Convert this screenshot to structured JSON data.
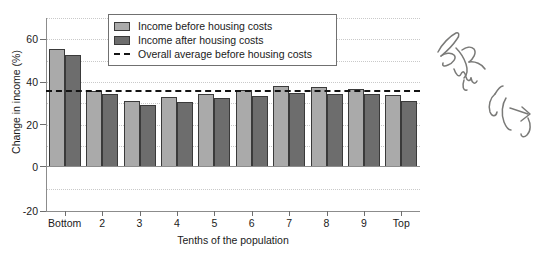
{
  "chart_data": {
    "type": "bar",
    "title": "",
    "xlabel": "Tenths of the population",
    "ylabel": "Change in income (%)",
    "categories": [
      "Bottom",
      "2",
      "3",
      "4",
      "5",
      "6",
      "7",
      "8",
      "9",
      "Top"
    ],
    "series": [
      {
        "name": "Income before housing costs",
        "color": "#aaaaaa",
        "values": [
          55,
          35.5,
          31,
          32.5,
          34,
          36,
          38,
          37.5,
          36.5,
          33.5
        ]
      },
      {
        "name": "Income after housing costs",
        "color": "#6d6d6d",
        "values": [
          52,
          34,
          29,
          30.5,
          32,
          33,
          34.5,
          34,
          34,
          31
        ]
      }
    ],
    "reference_line": {
      "name": "Overall average before housing costs",
      "value": 35.5,
      "style": "dashed",
      "color": "#141414"
    },
    "ylim": [
      -20,
      70
    ],
    "yticks": [
      -20,
      0,
      20,
      40,
      60
    ],
    "ytick_labels": [
      "-20",
      "0",
      "20",
      "40",
      "60"
    ],
    "gridlines": [
      -10,
      10,
      30,
      50,
      70
    ],
    "grid": true,
    "legend_position": "top-center"
  },
  "legend": {
    "items": [
      {
        "label": "Income before housing costs",
        "marker": "swatch-light"
      },
      {
        "label": "Income after housing costs",
        "marker": "swatch-dark"
      },
      {
        "label": "Overall average before housing costs",
        "marker": "dashed-line"
      }
    ]
  },
  "annotation": {
    "handwritten_note": "Between 6(-7)"
  }
}
